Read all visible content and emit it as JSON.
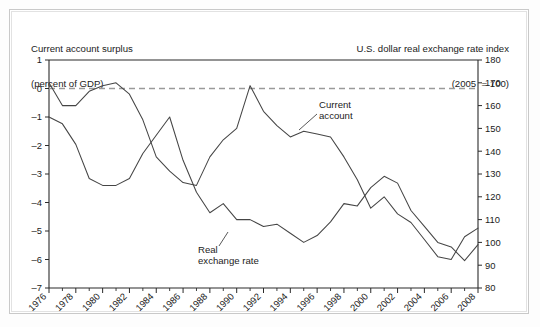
{
  "figure": {
    "background": "#ffffff",
    "frame_color": "#c9c9c9",
    "line_color": "#454545",
    "axis_color": "#2b2b2b",
    "zero_line_color": "#9a9a9a"
  },
  "header": {
    "left_line1": "Current account surplus",
    "left_line2": "(percent of GDP)",
    "right_line1": "U.S. dollar real exchange rate index",
    "right_line2": "(2005  = 100)"
  },
  "annotations": {
    "current_account": {
      "line1": "Current",
      "line2": "account"
    },
    "real_exchange_rate": {
      "line1": "Real",
      "line2": "exchange rate"
    }
  },
  "chart_data": {
    "type": "line",
    "title": "",
    "xlabel": "",
    "ylabel": "",
    "grid": false,
    "legend": "annotated-inline",
    "x": [
      1976,
      1977,
      1978,
      1979,
      1980,
      1981,
      1982,
      1983,
      1984,
      1985,
      1986,
      1987,
      1988,
      1989,
      1990,
      1991,
      1992,
      1993,
      1994,
      1995,
      1996,
      1997,
      1998,
      1999,
      2000,
      2001,
      2002,
      2003,
      2004,
      2005,
      2006,
      2007,
      2008
    ],
    "xtick_labels": [
      "1976",
      "1978",
      "1980",
      "1982",
      "1984",
      "1986",
      "1988",
      "1990",
      "1992",
      "1994",
      "1996",
      "1998",
      "2000",
      "2002",
      "2004",
      "2006",
      "2008"
    ],
    "xlim": [
      1976,
      2008
    ],
    "axes": [
      {
        "id": "left",
        "name": "Current account surplus (percent of GDP)",
        "ylim": [
          -7,
          1
        ],
        "yticks": [
          1,
          0,
          -1,
          -2,
          -3,
          -4,
          -5,
          -6,
          -7
        ],
        "ytick_labels": [
          "1",
          "0",
          "–1",
          "–2",
          "–3",
          "–4",
          "–5",
          "–6",
          "–7"
        ]
      },
      {
        "id": "right",
        "name": "U.S. dollar real exchange rate index (2005 = 100)",
        "ylim": [
          80,
          180
        ],
        "yticks": [
          180,
          170,
          160,
          150,
          140,
          130,
          120,
          110,
          100,
          90,
          80
        ],
        "ytick_labels": [
          "180",
          "170",
          "160",
          "150",
          "140",
          "130",
          "120",
          "110",
          "100",
          "90",
          "80"
        ]
      }
    ],
    "series": [
      {
        "name": "Current account",
        "axis": "left",
        "unit": "percent of GDP",
        "values": [
          0.2,
          -0.6,
          -0.6,
          -0.1,
          0.1,
          0.2,
          -0.2,
          -1.1,
          -2.4,
          -2.9,
          -3.3,
          -3.4,
          -2.4,
          -1.8,
          -1.4,
          0.1,
          -0.8,
          -1.3,
          -1.7,
          -1.5,
          -1.6,
          -1.7,
          -2.4,
          -3.2,
          -4.2,
          -3.8,
          -4.4,
          -4.7,
          -5.3,
          -5.9,
          -6.0,
          -5.2,
          -4.9
        ]
      },
      {
        "name": "Real exchange rate",
        "axis": "right",
        "unit": "index, 2005 = 100",
        "values": [
          155,
          152,
          143,
          128,
          125,
          125,
          128,
          139,
          147,
          155,
          136,
          122,
          113,
          117,
          110,
          110,
          107,
          108,
          104,
          100,
          103,
          109,
          117,
          116,
          124,
          129,
          126,
          114,
          107,
          100,
          98,
          92,
          99
        ]
      }
    ]
  }
}
